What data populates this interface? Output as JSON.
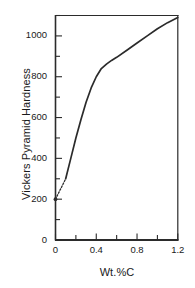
{
  "chart_data": {
    "type": "line",
    "title": "",
    "xlabel": "Wt.%C",
    "ylabel": "Vickers Pyramid Hardness",
    "xlim": [
      0,
      1.2
    ],
    "ylim": [
      0,
      1100
    ],
    "grid": false,
    "legend": "none",
    "xticks": [
      0,
      0.2,
      0.4,
      0.6,
      0.8,
      1.0,
      1.2
    ],
    "xticklabels": [
      "0",
      "",
      "0.4",
      "",
      "0.8",
      "",
      "1.2"
    ],
    "yticks": [
      0,
      100,
      200,
      300,
      400,
      500,
      600,
      700,
      800,
      900,
      1000,
      1100
    ],
    "yticklabels": [
      "0",
      "",
      "200",
      "",
      "400",
      "",
      "600",
      "",
      "800",
      "",
      "1000",
      ""
    ],
    "series": [
      {
        "name": "hardness-extrapolated",
        "style": "dotted",
        "x": [
          0.0,
          0.02,
          0.04,
          0.06,
          0.08,
          0.1
        ],
        "values": [
          200,
          220,
          240,
          260,
          280,
          300
        ]
      },
      {
        "name": "hardness-measured",
        "style": "solid",
        "x": [
          0.1,
          0.15,
          0.2,
          0.25,
          0.3,
          0.35,
          0.4,
          0.45,
          0.5,
          0.55,
          0.6,
          0.7,
          0.8,
          0.9,
          1.0,
          1.1,
          1.2
        ],
        "values": [
          300,
          400,
          500,
          590,
          675,
          745,
          800,
          840,
          862,
          880,
          895,
          930,
          965,
          1000,
          1035,
          1065,
          1090
        ]
      }
    ],
    "marker_points": [
      {
        "name": "origin-marker",
        "x": 0.0,
        "y": 200
      }
    ]
  },
  "axes": {
    "x_tick_labels": [
      "0",
      "0.4",
      "0.8",
      "1.2"
    ],
    "y_tick_labels": [
      "0",
      "200",
      "400",
      "600",
      "800",
      "1000"
    ],
    "x_axis_title": "Wt.%C",
    "y_axis_title": "Vickers Pyramid Hardness"
  },
  "colors": {
    "line": "#2b2b2b",
    "axis": "#2b2b2b",
    "background": "#ffffff",
    "text": "#1a1a1a"
  }
}
